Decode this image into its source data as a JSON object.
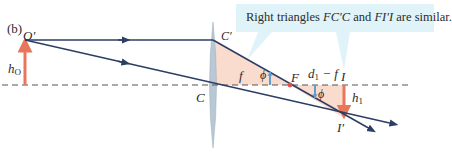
{
  "panel_label": "(b)",
  "callout": {
    "text_prefix": "Right triangles ",
    "tri1": "FC′C",
    "text_mid": " and ",
    "tri2": "FI′I",
    "text_suffix": " are similar."
  },
  "labels": {
    "object_top": "O′",
    "object_height": "h",
    "object_height_sub": "O",
    "lens_top": "C′",
    "lens_center": "C",
    "focal_length": "f",
    "focal_point": "F",
    "angle1": "ϕ",
    "angle2": "ϕ",
    "distance_part1": "d",
    "distance_part1_sub": "1",
    "distance_part2": " − f",
    "image_point": "I",
    "image_top": "I′",
    "image_height": "h",
    "image_height_sub": "1"
  },
  "colors": {
    "ray": "#2c3e63",
    "object_arrow": "#e8765a",
    "image_arrow": "#e8765a",
    "triangle_fill": "#f9dccd",
    "lens": "#b9c8d4",
    "angle_marker": "#5b9ed1",
    "callout_bg": "#dff3f8",
    "axis": "#555555",
    "focal_point": "#e0524a"
  }
}
